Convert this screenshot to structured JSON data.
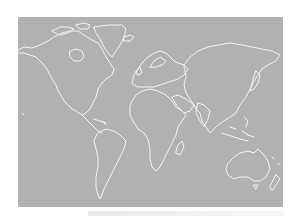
{
  "map": {
    "type": "world-outline-map",
    "projection": "equirectangular",
    "background_color": "#b1b1b1",
    "coastline_color": "#f4f4f4",
    "page_background": "#ffffff",
    "regions": [
      "North America",
      "Greenland",
      "South America",
      "Europe",
      "Africa",
      "Asia",
      "Australia",
      "New Zealand"
    ]
  },
  "caption": {
    "text": ""
  }
}
